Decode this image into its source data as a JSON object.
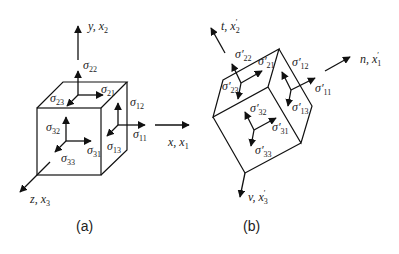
{
  "figure_a": {
    "caption": "(a)",
    "axes": [
      {
        "name": "y",
        "label": "y, x",
        "sub": "2",
        "prime": false
      },
      {
        "name": "x",
        "label": "x, x",
        "sub": "1",
        "prime": false
      },
      {
        "name": "z",
        "label": "z, x",
        "sub": "3",
        "prime": false
      }
    ],
    "stresses": [
      {
        "id": "s22",
        "sym": "σ",
        "sub": "22"
      },
      {
        "id": "s21",
        "sym": "σ",
        "sub": "21"
      },
      {
        "id": "s23",
        "sym": "σ",
        "sub": "23"
      },
      {
        "id": "s12",
        "sym": "σ",
        "sub": "12"
      },
      {
        "id": "s11",
        "sym": "σ",
        "sub": "11"
      },
      {
        "id": "s13",
        "sym": "σ",
        "sub": "13"
      },
      {
        "id": "s32",
        "sym": "σ",
        "sub": "32"
      },
      {
        "id": "s31",
        "sym": "σ",
        "sub": "31"
      },
      {
        "id": "s33",
        "sym": "σ",
        "sub": "33"
      }
    ]
  },
  "figure_b": {
    "caption": "(b)",
    "axes": [
      {
        "name": "t",
        "label": "t, x",
        "sub": "2",
        "prime": true
      },
      {
        "name": "n",
        "label": "n, x",
        "sub": "1",
        "prime": true
      },
      {
        "name": "v",
        "label": "v, x",
        "sub": "3",
        "prime": true
      }
    ],
    "stresses": [
      {
        "id": "s22",
        "sym": "σ′",
        "sub": "22"
      },
      {
        "id": "s21",
        "sym": "σ′",
        "sub": "21"
      },
      {
        "id": "s23",
        "sym": "σ′",
        "sub": "23"
      },
      {
        "id": "s12",
        "sym": "σ′",
        "sub": "12"
      },
      {
        "id": "s11",
        "sym": "σ′",
        "sub": "11"
      },
      {
        "id": "s13",
        "sym": "σ′",
        "sub": "13"
      },
      {
        "id": "s32",
        "sym": "σ′",
        "sub": "32"
      },
      {
        "id": "s31",
        "sym": "σ′",
        "sub": "31"
      },
      {
        "id": "s33",
        "sym": "σ′",
        "sub": "33"
      }
    ]
  }
}
